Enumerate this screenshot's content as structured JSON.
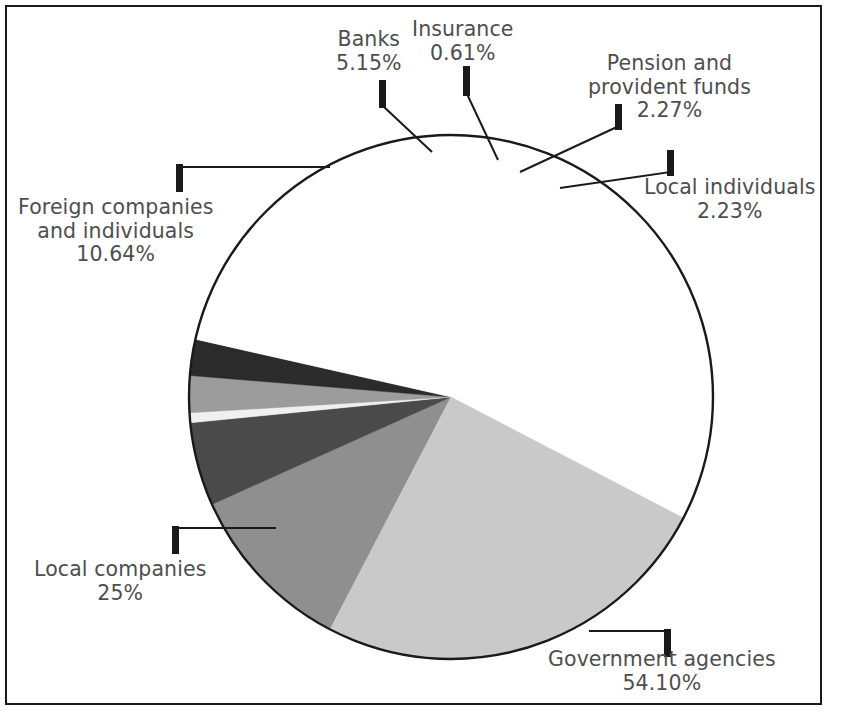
{
  "chart_data": {
    "type": "pie",
    "title": "",
    "subtitle": "",
    "xlabel": "",
    "ylabel": "",
    "legend_position": "none",
    "labels_outside": true,
    "units": "percent",
    "categories": [
      "Foreign companies and individuals",
      "Banks",
      "Insurance",
      "Pension and provident funds",
      "Local individuals",
      "Government agencies",
      "Local companies"
    ],
    "values": [
      10.64,
      5.15,
      0.61,
      2.27,
      2.23,
      54.1,
      25
    ],
    "value_labels": [
      "10.64%",
      "5.15%",
      "0.61%",
      "2.27%",
      "2.23%",
      "54.10%",
      "25%"
    ],
    "colors": [
      "#8f8f8f",
      "#4a4a4a",
      "#f0f0f0",
      "#9c9c9c",
      "#2b2b2b",
      "#ffffff",
      "#c9c9c9"
    ],
    "slices": [
      {
        "name": "Foreign companies and individuals",
        "label_line1": "Foreign companies",
        "label_line2": "and individuals",
        "value": 10.64,
        "value_label": "10.64%",
        "color": "#8f8f8f"
      },
      {
        "name": "Banks",
        "label_line1": "Banks",
        "label_line2": "",
        "value": 5.15,
        "value_label": "5.15%",
        "color": "#4a4a4a"
      },
      {
        "name": "Insurance",
        "label_line1": "Insurance",
        "label_line2": "",
        "value": 0.61,
        "value_label": "0.61%",
        "color": "#f0f0f0"
      },
      {
        "name": "Pension and provident funds",
        "label_line1": "Pension and",
        "label_line2": "provident funds",
        "value": 2.27,
        "value_label": "2.27%",
        "color": "#9c9c9c"
      },
      {
        "name": "Local individuals",
        "label_line1": "Local individuals",
        "label_line2": "",
        "value": 2.23,
        "value_label": "2.23%",
        "color": "#2b2b2b"
      },
      {
        "name": "Government agencies",
        "label_line1": "Government agencies",
        "label_line2": "",
        "value": 54.1,
        "value_label": "54.10%",
        "color": "#ffffff"
      },
      {
        "name": "Local companies",
        "label_line1": "Local companies",
        "label_line2": "",
        "value": 25,
        "value_label": "25%",
        "color": "#c9c9c9"
      }
    ],
    "outline_color": "#1a1a1a",
    "text_color": "#4e4e4e",
    "background": "#ffffff"
  },
  "labels": {
    "banks": {
      "line1": "Banks",
      "pct": "5.15%"
    },
    "insurance": {
      "line1": "Insurance",
      "pct": "0.61%"
    },
    "pension": {
      "line1": "Pension and",
      "line2": "provident funds",
      "pct": "2.27%"
    },
    "local_individuals": {
      "line1": "Local individuals",
      "pct": "2.23%"
    },
    "foreign": {
      "line1": "Foreign companies",
      "line2": "and individuals",
      "pct": "10.64%"
    },
    "local_companies": {
      "line1": "Local companies",
      "pct": "25%"
    },
    "government": {
      "line1": "Government agencies",
      "pct": "54.10%"
    }
  }
}
